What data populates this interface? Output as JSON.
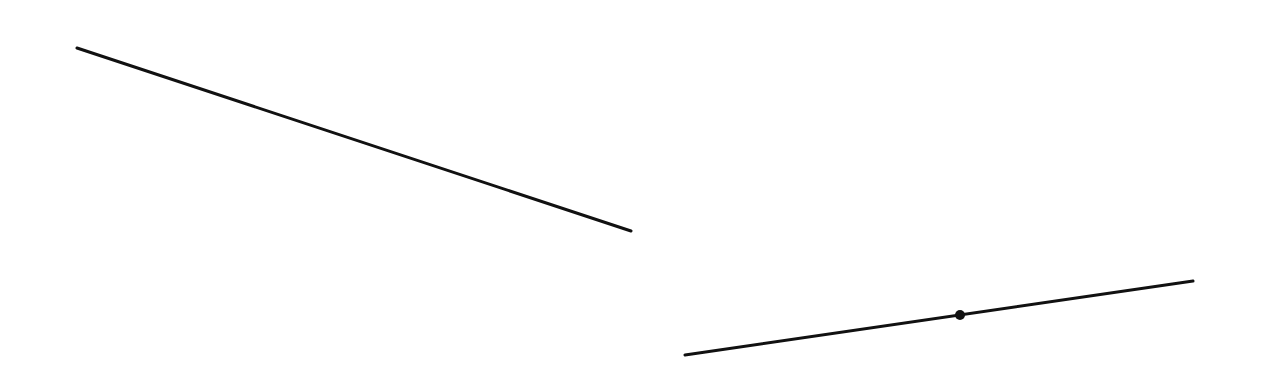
{
  "diagram": {
    "canvas": {
      "width": 1264,
      "height": 379,
      "background": "#ffffff"
    },
    "stroke_color": "#111111",
    "segments": [
      {
        "id": "segment-1",
        "x1": 77,
        "y1": 48,
        "x2": 631,
        "y2": 231,
        "stroke_width": 3
      },
      {
        "id": "segment-2",
        "x1": 685,
        "y1": 355,
        "x2": 1193,
        "y2": 281,
        "stroke_width": 3
      }
    ],
    "points": [
      {
        "id": "point-on-segment-2",
        "cx": 960,
        "cy": 315,
        "r": 5
      }
    ]
  }
}
